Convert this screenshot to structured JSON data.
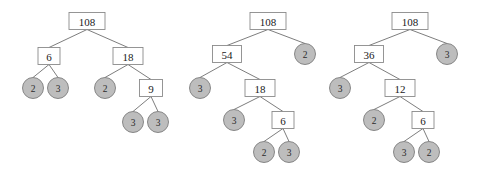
{
  "figure": {
    "background_color": "#ffffff",
    "box_fill": "#ffffff",
    "box_stroke": "#8a8a8a",
    "circle_fill": "#bdbdbd",
    "circle_stroke": "#7d7d7d",
    "edge_color": "#6e6e6e",
    "text_color": "#1a1a1a"
  },
  "chart_data": {
    "type": "diagram",
    "diagram_type": "factor-tree",
    "legend": [],
    "trees": [
      {
        "name": "tree-1",
        "root_value": "108",
        "leaf_values": [
          "2",
          "3",
          "2",
          "3",
          "3"
        ],
        "nodes": [
          {
            "id": "t1-n1",
            "label": "108",
            "shape": "box",
            "x": 87,
            "y": 21,
            "w": 36,
            "h": 17
          },
          {
            "id": "t1-n2",
            "label": "6",
            "shape": "box",
            "x": 49,
            "y": 56,
            "w": 22,
            "h": 17
          },
          {
            "id": "t1-n3",
            "label": "18",
            "shape": "box",
            "x": 128,
            "y": 56,
            "w": 30,
            "h": 17
          },
          {
            "id": "t1-n4",
            "label": "2",
            "shape": "circle",
            "x": 33,
            "y": 88,
            "w": 21,
            "h": 21
          },
          {
            "id": "t1-n5",
            "label": "3",
            "shape": "circle",
            "x": 58,
            "y": 88,
            "w": 21,
            "h": 21
          },
          {
            "id": "t1-n6",
            "label": "2",
            "shape": "circle",
            "x": 105,
            "y": 88,
            "w": 21,
            "h": 21
          },
          {
            "id": "t1-n7",
            "label": "9",
            "shape": "box",
            "x": 151,
            "y": 88,
            "w": 23,
            "h": 17
          },
          {
            "id": "t1-n8",
            "label": "3",
            "shape": "circle",
            "x": 133,
            "y": 122,
            "w": 21,
            "h": 21
          },
          {
            "id": "t1-n9",
            "label": "3",
            "shape": "circle",
            "x": 158,
            "y": 122,
            "w": 21,
            "h": 21
          }
        ],
        "edges": [
          [
            "t1-n1",
            "t1-n2"
          ],
          [
            "t1-n1",
            "t1-n3"
          ],
          [
            "t1-n2",
            "t1-n4"
          ],
          [
            "t1-n2",
            "t1-n5"
          ],
          [
            "t1-n3",
            "t1-n6"
          ],
          [
            "t1-n3",
            "t1-n7"
          ],
          [
            "t1-n7",
            "t1-n8"
          ],
          [
            "t1-n7",
            "t1-n9"
          ]
        ]
      },
      {
        "name": "tree-2",
        "root_value": "108",
        "leaf_values": [
          "3",
          "3",
          "2",
          "3",
          "2"
        ],
        "nodes": [
          {
            "id": "t2-n1",
            "label": "108",
            "shape": "box",
            "x": 268,
            "y": 21,
            "w": 36,
            "h": 17
          },
          {
            "id": "t2-n2",
            "label": "54",
            "shape": "box",
            "x": 227,
            "y": 54,
            "w": 29,
            "h": 17
          },
          {
            "id": "t2-n3",
            "label": "2",
            "shape": "circle",
            "x": 305,
            "y": 54,
            "w": 21,
            "h": 21
          },
          {
            "id": "t2-n4",
            "label": "3",
            "shape": "circle",
            "x": 200,
            "y": 88,
            "w": 21,
            "h": 21
          },
          {
            "id": "t2-n5",
            "label": "18",
            "shape": "box",
            "x": 260,
            "y": 88,
            "w": 30,
            "h": 17
          },
          {
            "id": "t2-n6",
            "label": "3",
            "shape": "circle",
            "x": 234,
            "y": 120,
            "w": 21,
            "h": 21
          },
          {
            "id": "t2-n7",
            "label": "6",
            "shape": "box",
            "x": 283,
            "y": 120,
            "w": 22,
            "h": 17
          },
          {
            "id": "t2-n8",
            "label": "2",
            "shape": "circle",
            "x": 264,
            "y": 152,
            "w": 21,
            "h": 21
          },
          {
            "id": "t2-n9",
            "label": "3",
            "shape": "circle",
            "x": 289,
            "y": 152,
            "w": 21,
            "h": 21
          }
        ],
        "edges": [
          [
            "t2-n1",
            "t2-n2"
          ],
          [
            "t2-n1",
            "t2-n3"
          ],
          [
            "t2-n2",
            "t2-n4"
          ],
          [
            "t2-n2",
            "t2-n5"
          ],
          [
            "t2-n5",
            "t2-n6"
          ],
          [
            "t2-n5",
            "t2-n7"
          ],
          [
            "t2-n7",
            "t2-n8"
          ],
          [
            "t2-n7",
            "t2-n9"
          ]
        ]
      },
      {
        "name": "tree-3",
        "root_value": "108",
        "leaf_values": [
          "3",
          "3",
          "2",
          "3",
          "2"
        ],
        "nodes": [
          {
            "id": "t3-n1",
            "label": "108",
            "shape": "box",
            "x": 410,
            "y": 21,
            "w": 36,
            "h": 17
          },
          {
            "id": "t3-n2",
            "label": "36",
            "shape": "box",
            "x": 369,
            "y": 54,
            "w": 29,
            "h": 17
          },
          {
            "id": "t3-n3",
            "label": "3",
            "shape": "circle",
            "x": 447,
            "y": 54,
            "w": 21,
            "h": 21
          },
          {
            "id": "t3-n4",
            "label": "3",
            "shape": "circle",
            "x": 340,
            "y": 88,
            "w": 21,
            "h": 21
          },
          {
            "id": "t3-n5",
            "label": "12",
            "shape": "box",
            "x": 400,
            "y": 88,
            "w": 30,
            "h": 17
          },
          {
            "id": "t3-n6",
            "label": "2",
            "shape": "circle",
            "x": 374,
            "y": 120,
            "w": 21,
            "h": 21
          },
          {
            "id": "t3-n7",
            "label": "6",
            "shape": "box",
            "x": 423,
            "y": 120,
            "w": 22,
            "h": 17
          },
          {
            "id": "t3-n8",
            "label": "3",
            "shape": "circle",
            "x": 404,
            "y": 152,
            "w": 21,
            "h": 21
          },
          {
            "id": "t3-n9",
            "label": "2",
            "shape": "circle",
            "x": 429,
            "y": 152,
            "w": 21,
            "h": 21
          }
        ],
        "edges": [
          [
            "t3-n1",
            "t3-n2"
          ],
          [
            "t3-n1",
            "t3-n3"
          ],
          [
            "t3-n2",
            "t3-n4"
          ],
          [
            "t3-n2",
            "t3-n5"
          ],
          [
            "t3-n5",
            "t3-n6"
          ],
          [
            "t3-n5",
            "t3-n7"
          ],
          [
            "t3-n7",
            "t3-n8"
          ],
          [
            "t3-n7",
            "t3-n9"
          ]
        ]
      }
    ]
  }
}
